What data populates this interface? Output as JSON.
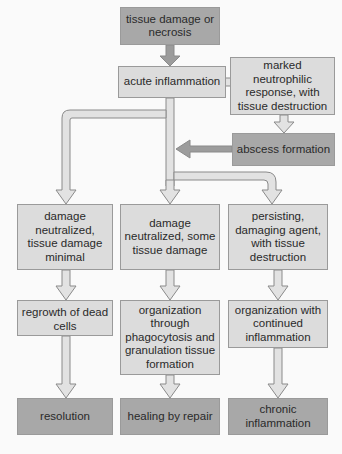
{
  "diagram": {
    "nodes": {
      "tissue_damage": "tissue damage or necrosis",
      "acute_inflammation": "acute inflammation",
      "neutrophilic": "marked neutrophilic response, with tissue destruction",
      "abscess": "abscess formation",
      "damage_minimal": "damage neutralized, tissue damage minimal",
      "damage_some": "damage neutralized, some tissue damage",
      "persisting": "persisting, damaging agent, with tissue destruction",
      "regrowth": "regrowth of dead cells",
      "organization_phago": "organization through phagocytosis and granulation tissue formation",
      "organization_continued": "organization with continued inflammation",
      "resolution": "resolution",
      "healing": "healing by repair",
      "chronic": "chronic inflammation"
    },
    "colors": {
      "light_box": "#dcdcdc",
      "dark_box": "#a8a8a8",
      "arrow_fill": "#e4e4e4",
      "dark_arrow": "#9a9a9a"
    }
  }
}
